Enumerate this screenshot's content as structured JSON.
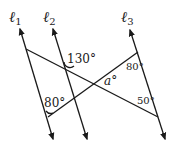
{
  "diagram": {
    "type": "geometry",
    "lines": [
      {
        "name": "ℓ1",
        "label_base": "ℓ",
        "label_sub": "1"
      },
      {
        "name": "ℓ2",
        "label_base": "ℓ",
        "label_sub": "2"
      },
      {
        "name": "ℓ3",
        "label_base": "ℓ",
        "label_sub": "3"
      }
    ],
    "angles": {
      "top_l2": "130°",
      "top_l3": "80°",
      "bottom_l1": "80°",
      "bottom_l3": "50°",
      "unknown": "a°",
      "unknown_var": "a",
      "degree": "°"
    },
    "colors": {
      "line": "#1a1a1a",
      "background": "#ffffff"
    }
  }
}
